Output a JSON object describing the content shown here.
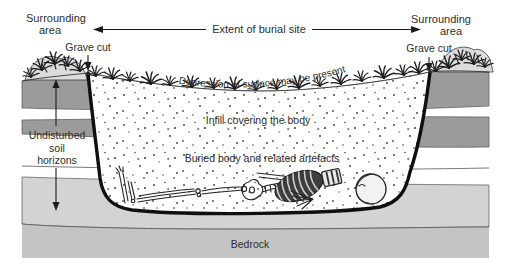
{
  "figure": {
    "type": "cross-section-diagram",
    "labels": {
      "surrounding_left_line1": "Surrounding",
      "surrounding_left_line2": "area",
      "surrounding_right_line1": "Surrounding",
      "surrounding_right_line2": "area",
      "extent": "Extent of burial site",
      "grave_cut_left": "Grave cut",
      "grave_cut_right": "Grave cut",
      "depression": "Depression of surface may be present",
      "infill": "Infill covering the body",
      "buried": "Buried body and related artefacts",
      "undisturbed_line1": "Undisturbed",
      "undisturbed_line2": "soil",
      "undisturbed_line3": "horizons",
      "bedrock": "Bedrock"
    }
  },
  "colors": {
    "soil": "#9b9b9b",
    "soil_light": "#d3d3d3",
    "bedrock_fill": "#c4c4c4",
    "rock": "#dcdcdc",
    "ink": "#1c1c1c",
    "text": "#2d2d2d",
    "stipple": "#4a4a4a",
    "band_edge": "#555555",
    "cut": "#0f0f0f",
    "rib_fill": "#3d3d3d"
  }
}
